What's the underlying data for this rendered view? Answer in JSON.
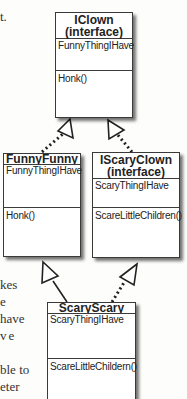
{
  "diagram": {
    "type": "uml-class-diagram",
    "classes": [
      {
        "id": "iclown",
        "name": "IClown",
        "stereotype": "(interface)",
        "fields": [
          "FunnyThingIHave"
        ],
        "methods": [
          "Honk()"
        ]
      },
      {
        "id": "funnyfunny",
        "name": "FunnyFunny",
        "stereotype": "",
        "fields": [
          "FunnyThingIHave"
        ],
        "methods": [
          "Honk()"
        ]
      },
      {
        "id": "iscaryclown",
        "name": "IScaryClown",
        "stereotype": "(interface)",
        "fields": [
          "ScaryThingIHave"
        ],
        "methods": [
          "ScareLittleChildren()"
        ]
      },
      {
        "id": "scaryscary",
        "name": "ScaryScary",
        "stereotype": "",
        "fields": [
          "ScaryThingIHave"
        ],
        "methods": [
          "ScareLittleChildern()"
        ]
      }
    ],
    "relationships": [
      {
        "from": "funnyfunny",
        "to": "iclown",
        "kind": "realization",
        "line": "dotted"
      },
      {
        "from": "iscaryclown",
        "to": "iclown",
        "kind": "realization",
        "line": "dotted"
      },
      {
        "from": "scaryscary",
        "to": "funnyfunny",
        "kind": "inheritance",
        "line": "solid"
      },
      {
        "from": "scaryscary",
        "to": "iscaryclown",
        "kind": "realization",
        "line": "dotted"
      }
    ]
  },
  "side_text": {
    "top_fragment": "t.",
    "lines": [
      "kes",
      "e",
      "have",
      "ve",
      "",
      "ble to",
      "eter"
    ]
  },
  "colors": {
    "line": "#222222",
    "box_border": "#3a3a3a",
    "background": "#fdfdfb"
  }
}
